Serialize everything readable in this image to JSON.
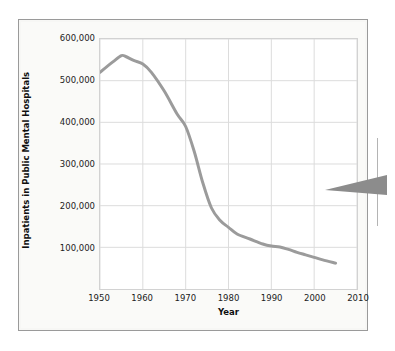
{
  "figure": {
    "frame_color": "#9a9a9a",
    "background_color": "#fafaf8"
  },
  "callout": {
    "name": "callout-pointer",
    "arrow_color": "#8c8c8c"
  },
  "chart_data": {
    "type": "line",
    "title": "",
    "xlabel": "Year",
    "ylabel": "Inpatients in Public Mental Hospitals",
    "xlim": [
      1950,
      2010
    ],
    "ylim": [
      0,
      600000
    ],
    "grid": true,
    "legend": "none",
    "line_color": "#9b9b9b",
    "line_width": 3,
    "xticks": [
      1950,
      1960,
      1970,
      1980,
      1990,
      2000,
      2010
    ],
    "xtick_labels": [
      "1950",
      "1960",
      "1970",
      "1980",
      "1990",
      "2000",
      "2010"
    ],
    "yticks": [
      100000,
      200000,
      300000,
      400000,
      500000,
      600000
    ],
    "ytick_labels": [
      "100,000",
      "200,000",
      "300,000",
      "400,000",
      "500,000",
      "600,000"
    ],
    "x": [
      1950,
      1953,
      1955,
      1956,
      1958,
      1960,
      1962,
      1965,
      1968,
      1970,
      1972,
      1974,
      1976,
      1978,
      1980,
      1982,
      1985,
      1988,
      1990,
      1992,
      1994,
      1996,
      1998,
      2000,
      2002,
      2005
    ],
    "values": [
      520000,
      545000,
      560000,
      558000,
      548000,
      540000,
      520000,
      475000,
      420000,
      390000,
      330000,
      255000,
      195000,
      165000,
      148000,
      132000,
      120000,
      108000,
      103000,
      101000,
      95000,
      88000,
      82000,
      76000,
      70000,
      62000
    ],
    "series": [
      {
        "name": "Inpatients in Public Mental Hospitals",
        "values": [
          520000,
          545000,
          560000,
          558000,
          548000,
          540000,
          520000,
          475000,
          420000,
          390000,
          330000,
          255000,
          195000,
          165000,
          148000,
          132000,
          120000,
          108000,
          103000,
          101000,
          95000,
          88000,
          82000,
          76000,
          70000,
          62000
        ]
      }
    ],
    "annotations": []
  }
}
